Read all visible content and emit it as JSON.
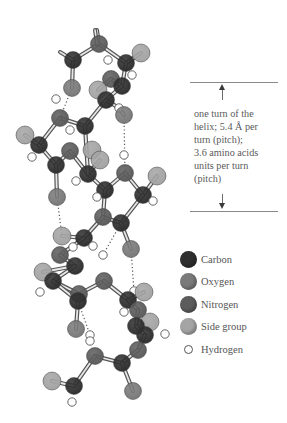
{
  "colors": {
    "carbon": "#2f2f2f",
    "oxygen": "#7a7a7a",
    "nitrogen": "#5c5c5c",
    "side_group": "#a4a4a4",
    "hydrogen": "#ffffff",
    "line": "#8a8a8a"
  },
  "annotation": {
    "lines": [
      "one turn of the",
      "helix; 5.4 Å per",
      "turn (pitch);",
      "3.6 amino acids",
      "units per turn",
      "(pitch)"
    ],
    "arrow_up": "arrow-up",
    "arrow_down": "arrow-down"
  },
  "legend": {
    "items": [
      {
        "label": "Carbon",
        "key": "carbon"
      },
      {
        "label": "Oxygen",
        "key": "oxygen"
      },
      {
        "label": "Nitrogen",
        "key": "nitrogen"
      },
      {
        "label": "Side group",
        "key": "side_group"
      },
      {
        "label": "Hydrogen",
        "key": "hydrogen"
      }
    ]
  },
  "molecule": {
    "atoms": [
      {
        "t": "N",
        "x": 99,
        "y": 44
      },
      {
        "t": "C",
        "x": 73,
        "y": 60
      },
      {
        "t": "S",
        "x": 141,
        "y": 53
      },
      {
        "t": "C",
        "x": 126,
        "y": 63
      },
      {
        "t": "H",
        "x": 108,
        "y": 60
      },
      {
        "t": "H",
        "x": 132,
        "y": 75
      },
      {
        "t": "O",
        "x": 72,
        "y": 88
      },
      {
        "t": "N",
        "x": 111,
        "y": 79
      },
      {
        "t": "C",
        "x": 122,
        "y": 86
      },
      {
        "t": "S",
        "x": 98,
        "y": 90
      },
      {
        "t": "C",
        "x": 106,
        "y": 100
      },
      {
        "t": "H",
        "x": 119,
        "y": 108
      },
      {
        "t": "O",
        "x": 124,
        "y": 115
      },
      {
        "t": "H",
        "x": 56,
        "y": 99
      },
      {
        "t": "N",
        "x": 60,
        "y": 118
      },
      {
        "t": "C",
        "x": 85,
        "y": 126
      },
      {
        "t": "H",
        "x": 70,
        "y": 130
      },
      {
        "t": "S",
        "x": 25,
        "y": 135
      },
      {
        "t": "C",
        "x": 39,
        "y": 145
      },
      {
        "t": "N",
        "x": 70,
        "y": 151
      },
      {
        "t": "H",
        "x": 32,
        "y": 157
      },
      {
        "t": "C",
        "x": 56,
        "y": 165
      },
      {
        "t": "S",
        "x": 92,
        "y": 150
      },
      {
        "t": "S",
        "x": 100,
        "y": 160
      },
      {
        "t": "C",
        "x": 88,
        "y": 174
      },
      {
        "t": "H",
        "x": 76,
        "y": 181
      },
      {
        "t": "H",
        "x": 124,
        "y": 155
      },
      {
        "t": "N",
        "x": 125,
        "y": 173
      },
      {
        "t": "S",
        "x": 157,
        "y": 176
      },
      {
        "t": "C",
        "x": 105,
        "y": 190
      },
      {
        "t": "C",
        "x": 143,
        "y": 195
      },
      {
        "t": "H",
        "x": 97,
        "y": 197
      },
      {
        "t": "H",
        "x": 153,
        "y": 201
      },
      {
        "t": "O",
        "x": 57,
        "y": 197
      },
      {
        "t": "N",
        "x": 103,
        "y": 217
      },
      {
        "t": "C",
        "x": 121,
        "y": 223
      },
      {
        "t": "S",
        "x": 62,
        "y": 236
      },
      {
        "t": "C",
        "x": 84,
        "y": 238
      },
      {
        "t": "O",
        "x": 131,
        "y": 249
      },
      {
        "t": "H",
        "x": 73,
        "y": 247
      },
      {
        "t": "H",
        "x": 103,
        "y": 255
      },
      {
        "t": "N",
        "x": 60,
        "y": 255
      },
      {
        "t": "C",
        "x": 75,
        "y": 266
      },
      {
        "t": "H",
        "x": 93,
        "y": 246
      },
      {
        "t": "S",
        "x": 43,
        "y": 272
      },
      {
        "t": "C",
        "x": 53,
        "y": 281
      },
      {
        "t": "H",
        "x": 40,
        "y": 292
      },
      {
        "t": "N",
        "x": 79,
        "y": 294
      },
      {
        "t": "N",
        "x": 104,
        "y": 281
      },
      {
        "t": "C",
        "x": 78,
        "y": 301
      },
      {
        "t": "H",
        "x": 134,
        "y": 291
      },
      {
        "t": "S",
        "x": 144,
        "y": 292
      },
      {
        "t": "C",
        "x": 128,
        "y": 300
      },
      {
        "t": "H",
        "x": 124,
        "y": 312
      },
      {
        "t": "N",
        "x": 138,
        "y": 310
      },
      {
        "t": "S",
        "x": 150,
        "y": 322
      },
      {
        "t": "C",
        "x": 136,
        "y": 326
      },
      {
        "t": "C",
        "x": 145,
        "y": 335
      },
      {
        "t": "H",
        "x": 165,
        "y": 334
      },
      {
        "t": "N",
        "x": 138,
        "y": 350
      },
      {
        "t": "O",
        "x": 76,
        "y": 329
      },
      {
        "t": "H",
        "x": 90,
        "y": 335
      },
      {
        "t": "N",
        "x": 95,
        "y": 356
      },
      {
        "t": "C",
        "x": 122,
        "y": 363
      },
      {
        "t": "H",
        "x": 90,
        "y": 341
      },
      {
        "t": "S",
        "x": 52,
        "y": 381
      },
      {
        "t": "C",
        "x": 74,
        "y": 386
      },
      {
        "t": "H",
        "x": 72,
        "y": 402
      },
      {
        "t": "O",
        "x": 133,
        "y": 391
      }
    ],
    "bonds": [
      [
        1,
        0
      ],
      [
        0,
        3
      ],
      [
        3,
        2
      ],
      [
        3,
        8
      ],
      [
        8,
        7
      ],
      [
        7,
        9
      ],
      [
        8,
        10
      ],
      [
        10,
        11
      ],
      [
        11,
        12
      ],
      [
        1,
        6
      ],
      [
        0,
        98
      ],
      [
        14,
        15
      ],
      [
        15,
        10
      ],
      [
        14,
        18
      ],
      [
        18,
        17
      ],
      [
        18,
        21
      ],
      [
        21,
        19
      ],
      [
        19,
        24
      ],
      [
        24,
        23
      ],
      [
        24,
        29
      ],
      [
        15,
        24
      ],
      [
        29,
        27
      ],
      [
        27,
        30
      ],
      [
        30,
        28
      ],
      [
        29,
        34
      ],
      [
        34,
        35
      ],
      [
        35,
        30
      ],
      [
        35,
        38
      ],
      [
        21,
        33
      ],
      [
        37,
        36
      ],
      [
        37,
        34
      ],
      [
        37,
        41
      ],
      [
        41,
        42
      ],
      [
        42,
        44
      ],
      [
        42,
        45
      ],
      [
        45,
        47
      ],
      [
        47,
        48
      ],
      [
        48,
        52
      ],
      [
        52,
        51
      ],
      [
        52,
        54
      ],
      [
        54,
        56
      ],
      [
        56,
        57
      ],
      [
        57,
        59
      ],
      [
        59,
        63
      ],
      [
        63,
        62
      ],
      [
        62,
        66
      ],
      [
        66,
        65
      ],
      [
        63,
        68
      ],
      [
        45,
        49
      ],
      [
        49,
        60
      ]
    ],
    "hbonds": [
      [
        6,
        14
      ],
      [
        12,
        27
      ],
      [
        33,
        36
      ],
      [
        35,
        40
      ],
      [
        38,
        50
      ],
      [
        49,
        61
      ]
    ]
  }
}
